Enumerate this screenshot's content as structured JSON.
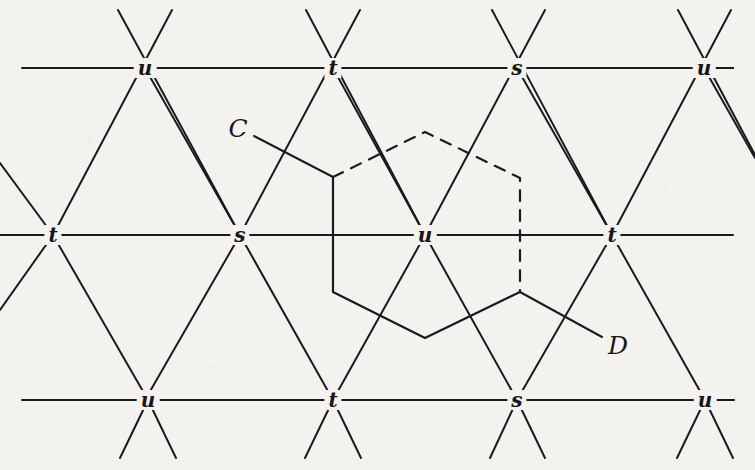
{
  "figure": {
    "kind": "triangular-lattice-diagram",
    "width": 755,
    "height": 470,
    "background_color": "#f4f2ee",
    "ink_color": "#1b1a1e",
    "line_width": 2.0
  },
  "nodes": [
    {
      "label": "u",
      "x": 145,
      "y": 68,
      "row": "top",
      "name": "node-top-u-1"
    },
    {
      "label": "t",
      "x": 333,
      "y": 68,
      "row": "top",
      "name": "node-top-t"
    },
    {
      "label": "s",
      "x": 517,
      "y": 68,
      "row": "top",
      "name": "node-top-s"
    },
    {
      "label": "u",
      "x": 704,
      "y": 68,
      "row": "top",
      "name": "node-top-u-2"
    },
    {
      "label": "t",
      "x": 53,
      "y": 235,
      "row": "middle",
      "name": "node-mid-t-1"
    },
    {
      "label": "s",
      "x": 240,
      "y": 235,
      "row": "middle",
      "name": "node-mid-s"
    },
    {
      "label": "u",
      "x": 425,
      "y": 235,
      "row": "middle",
      "name": "node-mid-u"
    },
    {
      "label": "t",
      "x": 612,
      "y": 235,
      "row": "middle",
      "name": "node-mid-t-2"
    },
    {
      "label": "u",
      "x": 148,
      "y": 400,
      "row": "bottom",
      "name": "node-bot-u-1"
    },
    {
      "label": "t",
      "x": 333,
      "y": 400,
      "row": "bottom",
      "name": "node-bot-t"
    },
    {
      "label": "s",
      "x": 517,
      "y": 400,
      "row": "bottom",
      "name": "node-bot-s"
    },
    {
      "label": "u",
      "x": 705,
      "y": 400,
      "row": "bottom",
      "name": "node-bot-u-2"
    }
  ],
  "horizontal_lines": [
    {
      "name": "row-line-top",
      "x1": 22,
      "y1": 68,
      "x2": 733,
      "y2": 68
    },
    {
      "name": "row-line-middle",
      "x1": 0,
      "y1": 235,
      "x2": 733,
      "y2": 235
    },
    {
      "name": "row-line-bottom",
      "x1": 22,
      "y1": 400,
      "x2": 733,
      "y2": 400
    }
  ],
  "diagonal_lines": [
    {
      "name": "diag-a-1",
      "x1": 118,
      "y1": 10,
      "x2": 240,
      "y2": 235
    },
    {
      "name": "diag-a-2",
      "x1": 306,
      "y1": 10,
      "x2": 425,
      "y2": 235
    },
    {
      "name": "diag-a-3",
      "x1": 492,
      "y1": 10,
      "x2": 612,
      "y2": 235
    },
    {
      "name": "diag-a-4",
      "x1": 678,
      "y1": 10,
      "x2": 755,
      "y2": 155
    },
    {
      "name": "diag-a-5",
      "x1": 0,
      "y1": 163,
      "x2": 53,
      "y2": 235
    },
    {
      "name": "diag-a-6",
      "x1": 240,
      "y1": 235,
      "x2": 333,
      "y2": 400
    },
    {
      "name": "diag-a-7",
      "x1": 425,
      "y1": 235,
      "x2": 517,
      "y2": 400
    },
    {
      "name": "diag-a-8",
      "x1": 612,
      "y1": 235,
      "x2": 705,
      "y2": 400
    },
    {
      "name": "diag-a-9",
      "x1": 53,
      "y1": 235,
      "x2": 148,
      "y2": 400
    },
    {
      "name": "diag-a-10",
      "x1": 120,
      "y1": 458,
      "x2": 148,
      "y2": 400
    },
    {
      "name": "diag-a-11",
      "x1": 305,
      "y1": 458,
      "x2": 333,
      "y2": 400
    },
    {
      "name": "diag-a-12",
      "x1": 490,
      "y1": 458,
      "x2": 517,
      "y2": 400
    },
    {
      "name": "diag-a-13",
      "x1": 677,
      "y1": 458,
      "x2": 705,
      "y2": 400
    },
    {
      "name": "diag-b-1",
      "x1": 172,
      "y1": 10,
      "x2": 53,
      "y2": 235
    },
    {
      "name": "diag-b-2",
      "x1": 360,
      "y1": 10,
      "x2": 240,
      "y2": 235
    },
    {
      "name": "diag-b-3",
      "x1": 545,
      "y1": 10,
      "x2": 425,
      "y2": 235
    },
    {
      "name": "diag-b-4",
      "x1": 731,
      "y1": 10,
      "x2": 612,
      "y2": 235
    },
    {
      "name": "diag-b-5",
      "x1": 145,
      "y1": 68,
      "x2": 240,
      "y2": 235
    },
    {
      "name": "diag-b-6",
      "x1": 333,
      "y1": 68,
      "x2": 425,
      "y2": 235
    },
    {
      "name": "diag-b-7",
      "x1": 517,
      "y1": 68,
      "x2": 612,
      "y2": 235
    },
    {
      "name": "diag-b-8",
      "x1": 704,
      "y1": 68,
      "x2": 755,
      "y2": 158
    },
    {
      "name": "diag-b-9",
      "x1": 240,
      "y1": 235,
      "x2": 145,
      "y2": 400
    },
    {
      "name": "diag-b-10",
      "x1": 425,
      "y1": 235,
      "x2": 333,
      "y2": 400
    },
    {
      "name": "diag-b-11",
      "x1": 612,
      "y1": 235,
      "x2": 517,
      "y2": 400
    },
    {
      "name": "diag-b-12",
      "x1": 53,
      "y1": 235,
      "x2": 0,
      "y2": 310
    },
    {
      "name": "diag-b-13",
      "x1": 176,
      "y1": 458,
      "x2": 148,
      "y2": 400
    },
    {
      "name": "diag-b-14",
      "x1": 361,
      "y1": 458,
      "x2": 333,
      "y2": 400
    },
    {
      "name": "diag-b-15",
      "x1": 545,
      "y1": 458,
      "x2": 517,
      "y2": 400
    },
    {
      "name": "diag-b-16",
      "x1": 733,
      "y1": 458,
      "x2": 705,
      "y2": 400
    }
  ],
  "hexagon": {
    "name": "central-hexagon",
    "vertices": [
      {
        "x": 333,
        "y": 177
      },
      {
        "x": 425,
        "y": 132
      },
      {
        "x": 520,
        "y": 178
      },
      {
        "x": 520,
        "y": 292
      },
      {
        "x": 425,
        "y": 338
      },
      {
        "x": 333,
        "y": 292
      }
    ],
    "solid_path": "M 520 292 L 425 338 L 333 292 L 333 177",
    "dashed_path": "M 333 177 L 425 132 L 520 178 L 520 292",
    "dash_pattern": "11 9"
  },
  "annotations": [
    {
      "name": "label-c",
      "text": "C",
      "x": 238,
      "y": 128,
      "leader": {
        "x1": 254,
        "y1": 136,
        "x2": 333,
        "y2": 177
      }
    },
    {
      "name": "label-d",
      "text": "D",
      "x": 618,
      "y": 345,
      "leader": {
        "x1": 602,
        "y1": 337,
        "x2": 520,
        "y2": 292
      }
    }
  ],
  "edge_stubs": [
    {
      "name": "stub-top-right",
      "x1": 714,
      "y1": 68,
      "x2": 733,
      "y2": 68
    },
    {
      "name": "stub-bottom-right",
      "x1": 715,
      "y1": 400,
      "x2": 734,
      "y2": 400
    }
  ]
}
